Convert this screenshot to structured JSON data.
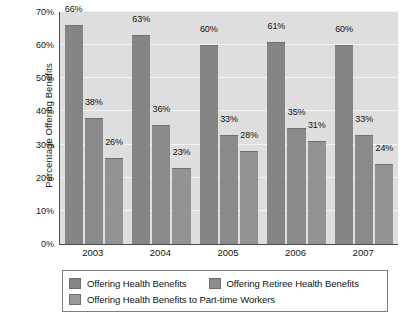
{
  "chart_data": {
    "type": "bar",
    "title": "",
    "subtitle": "",
    "xlabel": "",
    "ylabel": "Percentage Offering Benefits",
    "categories": [
      "2003",
      "2004",
      "2005",
      "2006",
      "2007"
    ],
    "series": [
      {
        "name": "Offering Health Benefits",
        "values": [
          66,
          63,
          60,
          61,
          60
        ],
        "labels": [
          "66%",
          "63%",
          "60%",
          "61%",
          "60%"
        ],
        "color": "#858585"
      },
      {
        "name": "Offering Retiree Health Benefits",
        "values": [
          38,
          36,
          33,
          35,
          33
        ],
        "labels": [
          "38%",
          "36%",
          "33%",
          "35%",
          "33%"
        ],
        "color": "#8a8a8a"
      },
      {
        "name": "Offering Health Benefits to Part-time Workers",
        "values": [
          26,
          23,
          28,
          31,
          24
        ],
        "labels": [
          "26%",
          "23%",
          "28%",
          "31%",
          "24%"
        ],
        "color": "#939393"
      }
    ],
    "ylim": [
      0,
      70
    ],
    "ytick_values": [
      0,
      10,
      20,
      30,
      40,
      50,
      60,
      70
    ],
    "ytick_labels": [
      "0%",
      "10%",
      "20%",
      "30%",
      "40%",
      "50%",
      "60%",
      "70%"
    ],
    "grid": true,
    "grid_axis": "y",
    "legend_position": "bottom",
    "plot_background": "#dedede",
    "gridline_color": "#f4f4f4",
    "axis_color": "#4d4d4d"
  },
  "legend": {
    "items": [
      {
        "label": "Offering Health Benefits",
        "swatch": "s0"
      },
      {
        "label": "Offering Retiree Health Benefits",
        "swatch": "s1"
      },
      {
        "label": "Offering Health Benefits to Part-time Workers",
        "swatch": "s2"
      }
    ]
  }
}
